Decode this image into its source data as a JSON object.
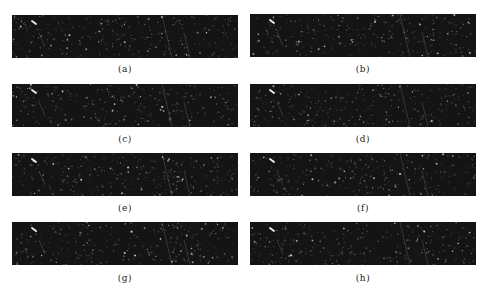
{
  "figure": {
    "panels": [
      {
        "label": "(a)",
        "content": "texture-image"
      },
      {
        "label": "(b)",
        "content": "texture-image"
      },
      {
        "label": "(c)",
        "content": "texture-image"
      },
      {
        "label": "(d)",
        "content": "texture-image"
      },
      {
        "label": "(e)",
        "content": "texture-image"
      },
      {
        "label": "(f)",
        "content": "texture-image"
      },
      {
        "label": "(g)",
        "content": "texture-image"
      },
      {
        "label": "(h)",
        "content": "texture-image"
      }
    ],
    "colors": {
      "panel_background": "#141414",
      "speckle": "#d8d8d8",
      "caption_text": "#222222"
    }
  }
}
